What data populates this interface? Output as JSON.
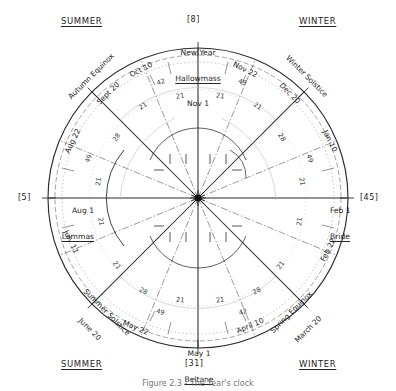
{
  "figure": {
    "kind": "hand-drawn-circular-calendar-diagram",
    "caption": "Figure 2.3 - The Year's clock",
    "center_label": "•"
  },
  "corners": {
    "top_left": "SUMMER",
    "top_right": "WINTER",
    "bottom_left": "SUMMER",
    "bottom_right": "WINTER"
  },
  "brackets": {
    "top": "[8]",
    "left": "[5]",
    "right": "[45]",
    "bottom": "[31]"
  },
  "cross_quarters": [
    {
      "name": "top",
      "line1": "New Year",
      "line2": "Hallowmass",
      "line3": "Nov 1"
    },
    {
      "name": "left",
      "line1": "",
      "line2": "Aug 1",
      "line3": "Lammas"
    },
    {
      "name": "right",
      "line1": "",
      "line2": "Feb 1",
      "line3": "Bride"
    },
    {
      "name": "bottom",
      "line1": "",
      "line2": "May 1",
      "line3": "Beltane"
    }
  ],
  "diagonals": [
    {
      "name": "autumn-equinox",
      "line1": "Autumn Equinox",
      "line2": "Sept 20",
      "angle": -45
    },
    {
      "name": "winter-solstice",
      "line1": "Winter Solstice",
      "line2": "Dec 20",
      "angle": 45
    },
    {
      "name": "summer-solstice",
      "line1": "Summer Solstice",
      "line2": "June 20",
      "angle": 45
    },
    {
      "name": "spring-equinox",
      "line1": "Spring Equinox",
      "line2": "March 20",
      "angle": -45
    }
  ],
  "midpoints": [
    {
      "name": "oct-10",
      "label": "Oct 10",
      "angle": -30
    },
    {
      "name": "nov-22",
      "label": "Nov 22",
      "angle": 30
    },
    {
      "name": "aug-22",
      "label": "Aug 22",
      "angle": -62
    },
    {
      "name": "jan-10",
      "label": "Jan 10",
      "angle": 62
    },
    {
      "name": "july-11",
      "label": "July 11",
      "angle": 62
    },
    {
      "name": "feb-22",
      "label": "Feb 22",
      "angle": -62
    },
    {
      "name": "may-22",
      "label": "May 22",
      "angle": 24
    },
    {
      "name": "april-10",
      "label": "April 10",
      "angle": -24
    }
  ],
  "ring_numbers": {
    "top_left_outer": "42",
    "top_right_outer": "49",
    "upper_left_21": "21",
    "upper_right_21": "21",
    "left_28": "28",
    "left_49": "49",
    "right_28": "28",
    "right_49": "49",
    "far_left_21": "21",
    "far_right_21": "21",
    "lower_left_21": "21",
    "lower_right_21": "21",
    "bottom_left_49": "49",
    "bottom_right_42": "42",
    "bottom_left_28": "28",
    "bottom_right_28": "28",
    "low_left_21": "21",
    "low_right_21": "21",
    "bl_21": "21",
    "br_21": "21"
  },
  "colors": {
    "ink": "#2b2b2b",
    "light_ink": "#6d6d6d",
    "paper": "#ffffff"
  }
}
